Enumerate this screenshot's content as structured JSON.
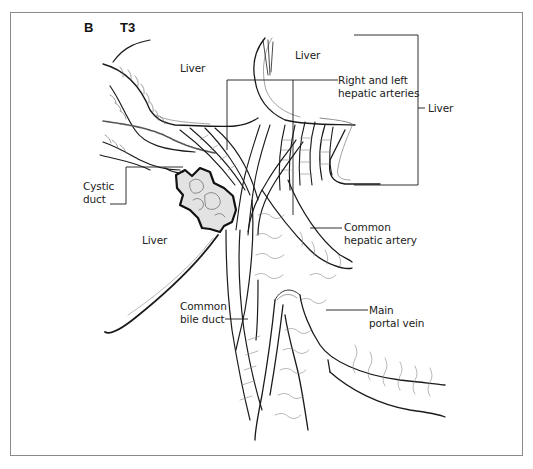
{
  "figure": {
    "panel_letter": "B",
    "stage": "T3"
  },
  "labels": {
    "liver_top_left": "Liver",
    "liver_top_right": "Liver",
    "right_left_hepatic_arteries": "Right and left\nhepatic arteries",
    "liver_right_bracket": "Liver",
    "cystic_duct": "Cystic\nduct",
    "liver_left_lower": "Liver",
    "common_hepatic_artery": "Common\nhepatic artery",
    "common_bile_duct": "Common\nbile duct",
    "main_portal_vein": "Main\nportal vein"
  },
  "colors": {
    "line": "#1a1a1a",
    "light_line": "#8a8a8a",
    "frame": "#8a8a8a",
    "tumor_fill": "#d9d9d9"
  }
}
